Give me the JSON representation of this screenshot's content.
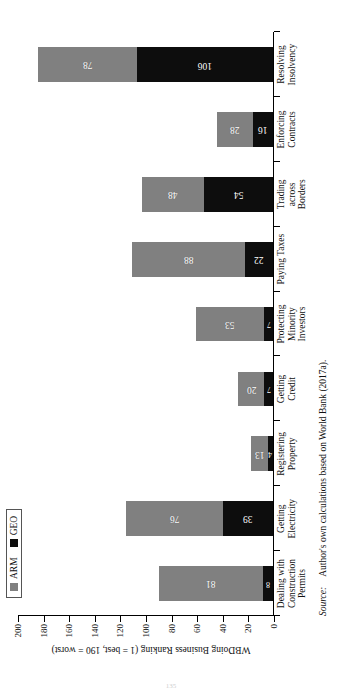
{
  "figure": {
    "legend": [
      {
        "key": "ARM",
        "label": "ARM",
        "color": "#808080"
      },
      {
        "key": "GEO",
        "label": "GEO",
        "color": "#0d0d0d"
      }
    ],
    "source_label": "Source:",
    "source_text": "Author's own calculations based on World Bank (2017a).",
    "folio": "135"
  },
  "chart_data": {
    "type": "bar",
    "orientation": "vertical-stacked",
    "title": "",
    "xlabel": "",
    "ylabel": "WBDoing Business Ranking (1 = best, 190 = worst)",
    "ylim": [
      0,
      200
    ],
    "yticks": [
      0,
      20,
      40,
      60,
      80,
      100,
      120,
      140,
      160,
      180,
      200
    ],
    "ytick_labels": [
      "0",
      "20",
      "40",
      "60",
      "80",
      "100",
      "120",
      "140",
      "160",
      "180",
      "200"
    ],
    "grid": false,
    "legend_position": "top-left",
    "categories": [
      "Dealing with Construction Permits",
      "Getting Electricity",
      "Registering Property",
      "Getting Credit",
      "Protecting Minority Investors",
      "Paying Taxes",
      "Trading across Borders",
      "Enforcing Contracts",
      "Resolving Insolvency"
    ],
    "category_lines": [
      [
        "Dealing with",
        "Construction",
        "Permits"
      ],
      [
        "Getting",
        "Electricity"
      ],
      [
        "Registering",
        "Property"
      ],
      [
        "Getting",
        "Credit"
      ],
      [
        "Protecting",
        "Minority",
        "Investors"
      ],
      [
        "Paying Taxes"
      ],
      [
        "Trading",
        "across",
        "Borders"
      ],
      [
        "Enforcing",
        "Contracts"
      ],
      [
        "Resolving",
        "Insolvency"
      ]
    ],
    "series": [
      {
        "name": "GEO",
        "color": "#0d0d0d",
        "values": [
          8,
          39,
          4,
          7,
          7,
          22,
          54,
          16,
          106
        ]
      },
      {
        "name": "ARM",
        "color": "#808080",
        "values": [
          81,
          76,
          13,
          20,
          53,
          88,
          48,
          28,
          78
        ]
      }
    ]
  }
}
